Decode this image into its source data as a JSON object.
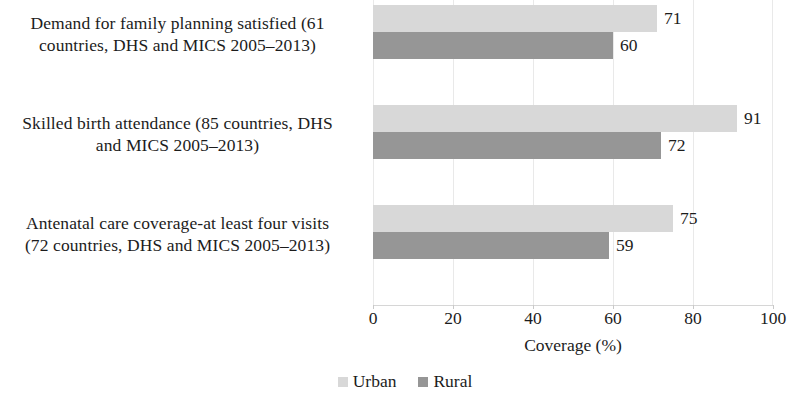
{
  "chart_data": {
    "type": "bar",
    "orientation": "horizontal",
    "title": "",
    "xlabel": "Coverage (%)",
    "ylabel": "",
    "xlim": [
      0,
      100
    ],
    "xticks": [
      "0",
      "20",
      "40",
      "60",
      "80",
      "100"
    ],
    "grid": "vertical-light",
    "legend_position": "bottom-center",
    "categories": [
      "Demand for family planning satisfied (61 countries, DHS and MICS 2005–2013)",
      "Skilled birth attendance (85 countries, DHS and MICS 2005–2013)",
      "Antenatal care coverage-at least four visits (72 countries, DHS and MICS 2005–2013)"
    ],
    "category_lines": [
      [
        "Demand for family planning satisfied (61",
        "countries, DHS and MICS 2005–2013)"
      ],
      [
        "Skilled birth attendance (85 countries, DHS",
        "and MICS 2005–2013)"
      ],
      [
        "Antenatal care coverage-at least four visits",
        "(72 countries, DHS and MICS 2005–2013)"
      ]
    ],
    "series": [
      {
        "name": "Urban",
        "color": "#d8d8d8",
        "values": [
          71,
          91,
          75
        ]
      },
      {
        "name": "Rural",
        "color": "#969696",
        "values": [
          60,
          72,
          59
        ]
      }
    ]
  },
  "labels": {
    "cat0_line0": "Demand for family planning satisfied (61",
    "cat0_line1": "countries, DHS and MICS 2005–2013)",
    "cat1_line0": "Skilled birth attendance (85 countries, DHS",
    "cat1_line1": "and MICS 2005–2013)",
    "cat2_line0": "Antenatal care coverage-at least four visits",
    "cat2_line1": "(72 countries, DHS and MICS 2005–2013)"
  },
  "values": {
    "g0_urban": "71",
    "g0_rural": "60",
    "g1_urban": "91",
    "g1_rural": "72",
    "g2_urban": "75",
    "g2_rural": "59"
  },
  "ticks": {
    "t0": "0",
    "t1": "20",
    "t2": "40",
    "t3": "60",
    "t4": "80",
    "t5": "100"
  },
  "axis": {
    "x_title": "Coverage (%)"
  },
  "legend": {
    "urban": "Urban",
    "rural": "Rural"
  }
}
